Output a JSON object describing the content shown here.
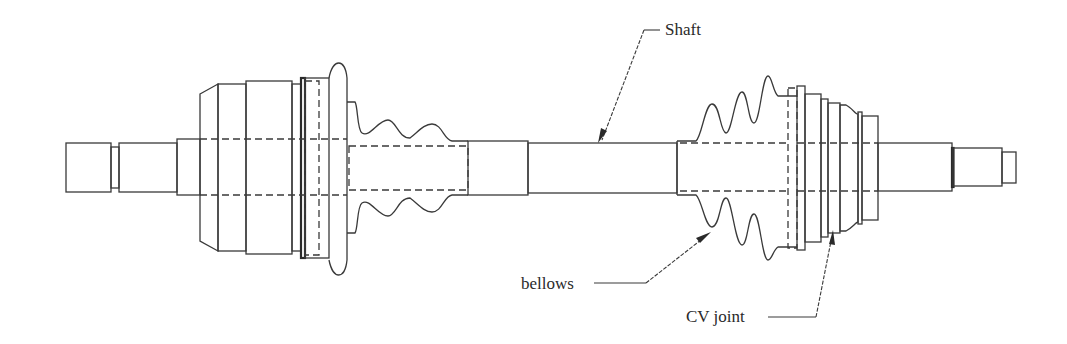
{
  "diagram": {
    "labels": {
      "shaft": "Shaft",
      "bellows": "bellows",
      "cv_joint": "CV joint"
    },
    "colors": {
      "line": "#3a3a3a",
      "background": "#ffffff",
      "text": "#2a2a2a"
    }
  }
}
